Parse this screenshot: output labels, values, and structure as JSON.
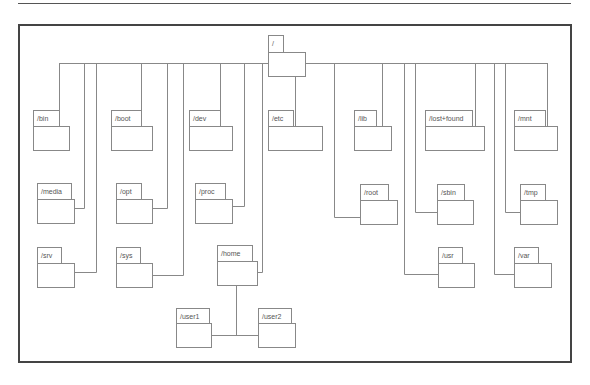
{
  "diagram": {
    "root": {
      "label": "/"
    },
    "nodes": [
      {
        "id": "bin",
        "label": "/bin"
      },
      {
        "id": "boot",
        "label": "/boot"
      },
      {
        "id": "dev",
        "label": "/dev"
      },
      {
        "id": "etc",
        "label": "/etc"
      },
      {
        "id": "lib",
        "label": "/lib"
      },
      {
        "id": "lostfound",
        "label": "/lost+found"
      },
      {
        "id": "mnt",
        "label": "/mnt"
      },
      {
        "id": "media",
        "label": "/media"
      },
      {
        "id": "opt",
        "label": "/opt"
      },
      {
        "id": "proc",
        "label": "/proc"
      },
      {
        "id": "root",
        "label": "/root"
      },
      {
        "id": "sbin",
        "label": "/sbin"
      },
      {
        "id": "tmp",
        "label": "/tmp"
      },
      {
        "id": "srv",
        "label": "/srv"
      },
      {
        "id": "sys",
        "label": "/sys"
      },
      {
        "id": "home",
        "label": "/home"
      },
      {
        "id": "usr",
        "label": "/usr"
      },
      {
        "id": "var",
        "label": "/var"
      },
      {
        "id": "user1",
        "label": "/user1",
        "parent": "home"
      },
      {
        "id": "user2",
        "label": "/user2",
        "parent": "home"
      }
    ]
  }
}
